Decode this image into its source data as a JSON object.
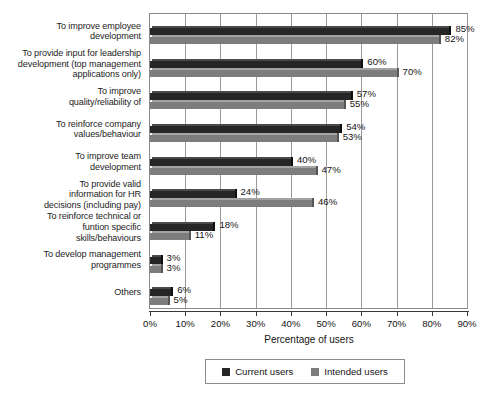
{
  "chart_data": {
    "type": "bar",
    "orientation": "horizontal",
    "title": "",
    "xlabel": "Percentage of users",
    "ylabel": "",
    "xlim": [
      0,
      90
    ],
    "xticks": [
      "0%",
      "10%",
      "20%",
      "30%",
      "40%",
      "50%",
      "60%",
      "70%",
      "80%",
      "90%"
    ],
    "grid": "vertical",
    "legend_position": "bottom",
    "categories": [
      "To improve employee development",
      "To provide input for leadership development (top management applications only)",
      "To improve quality/reliability of",
      "To reinforce company values/behaviour",
      "To improve team development",
      "To provide valid information for HR decisions (including pay)",
      "To reinforce technical or funtion specific skills/behaviours",
      "To develop management programmes",
      "Others"
    ],
    "category_lines": [
      [
        "To improve employee",
        "development"
      ],
      [
        "To provide input for leadership",
        "development (top management",
        "applications only)"
      ],
      [
        "To improve",
        "quality/reliability of"
      ],
      [
        "To reinforce company",
        "values/behaviour"
      ],
      [
        "To improve team",
        "development"
      ],
      [
        "To provide valid",
        "information for HR",
        "decisions (including pay)"
      ],
      [
        "To reinforce technical or",
        "funtion specific",
        "skills/behaviours"
      ],
      [
        "To develop management",
        "programmes"
      ],
      [
        "Others"
      ]
    ],
    "series": [
      {
        "name": "Current users",
        "color": "#262626",
        "values": [
          85,
          60,
          57,
          54,
          40,
          24,
          18,
          3,
          6
        ],
        "labels": [
          "85%",
          "60%",
          "57%",
          "54%",
          "40%",
          "24%",
          "18%",
          "3%",
          "6%"
        ]
      },
      {
        "name": "Intended users",
        "color": "#7d7d7d",
        "values": [
          82,
          70,
          55,
          53,
          47,
          46,
          11,
          3,
          5
        ],
        "labels": [
          "82%",
          "70%",
          "55%",
          "53%",
          "47%",
          "46%",
          "11%",
          "3%",
          "5%"
        ]
      }
    ]
  },
  "legend": {
    "items": [
      {
        "label": "Current users",
        "color": "#262626"
      },
      {
        "label": "Intended users",
        "color": "#7d7d7d"
      }
    ]
  }
}
